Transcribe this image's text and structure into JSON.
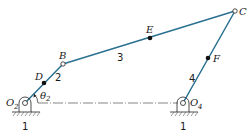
{
  "diagram": {
    "colors": {
      "link": "#2a7090",
      "ground": "#222222",
      "text": "#1a1a1a"
    },
    "points": {
      "O2": {
        "label": "O",
        "sub": "2",
        "x": 25,
        "y": 103
      },
      "D": {
        "label": "D",
        "x": 44,
        "y": 83
      },
      "B": {
        "label": "B",
        "x": 63,
        "y": 64
      },
      "E": {
        "label": "E",
        "x": 150,
        "y": 38
      },
      "C": {
        "label": "C",
        "x": 235,
        "y": 11
      },
      "F": {
        "label": "F",
        "x": 208,
        "y": 58
      },
      "O4": {
        "label": "O",
        "sub": "4",
        "x": 183,
        "y": 103
      }
    },
    "links": [
      {
        "id": "2",
        "label": "2",
        "from": "O2",
        "to": "B"
      },
      {
        "id": "3",
        "label": "3",
        "from": "B",
        "to": "C"
      },
      {
        "id": "4",
        "label": "4",
        "from": "O4",
        "to": "C"
      }
    ],
    "ground_labels": [
      "1",
      "1"
    ],
    "angle": {
      "symbol": "θ",
      "sub": "2"
    }
  }
}
